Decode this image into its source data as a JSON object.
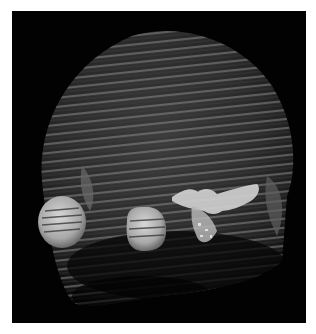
{
  "image": {
    "subject": "3D volume rendering of a head with striated slice lines",
    "background_color": "#020202",
    "page_color": "#ffffff",
    "structures": [
      {
        "name": "skull-shell",
        "color": "#7a7a7a"
      },
      {
        "name": "left-eye-globe",
        "color": "#c8c8c8"
      },
      {
        "name": "right-eye-globe",
        "color": "#c4c4c4"
      },
      {
        "name": "bright-lesion",
        "color": "#d6d6d6"
      }
    ]
  }
}
